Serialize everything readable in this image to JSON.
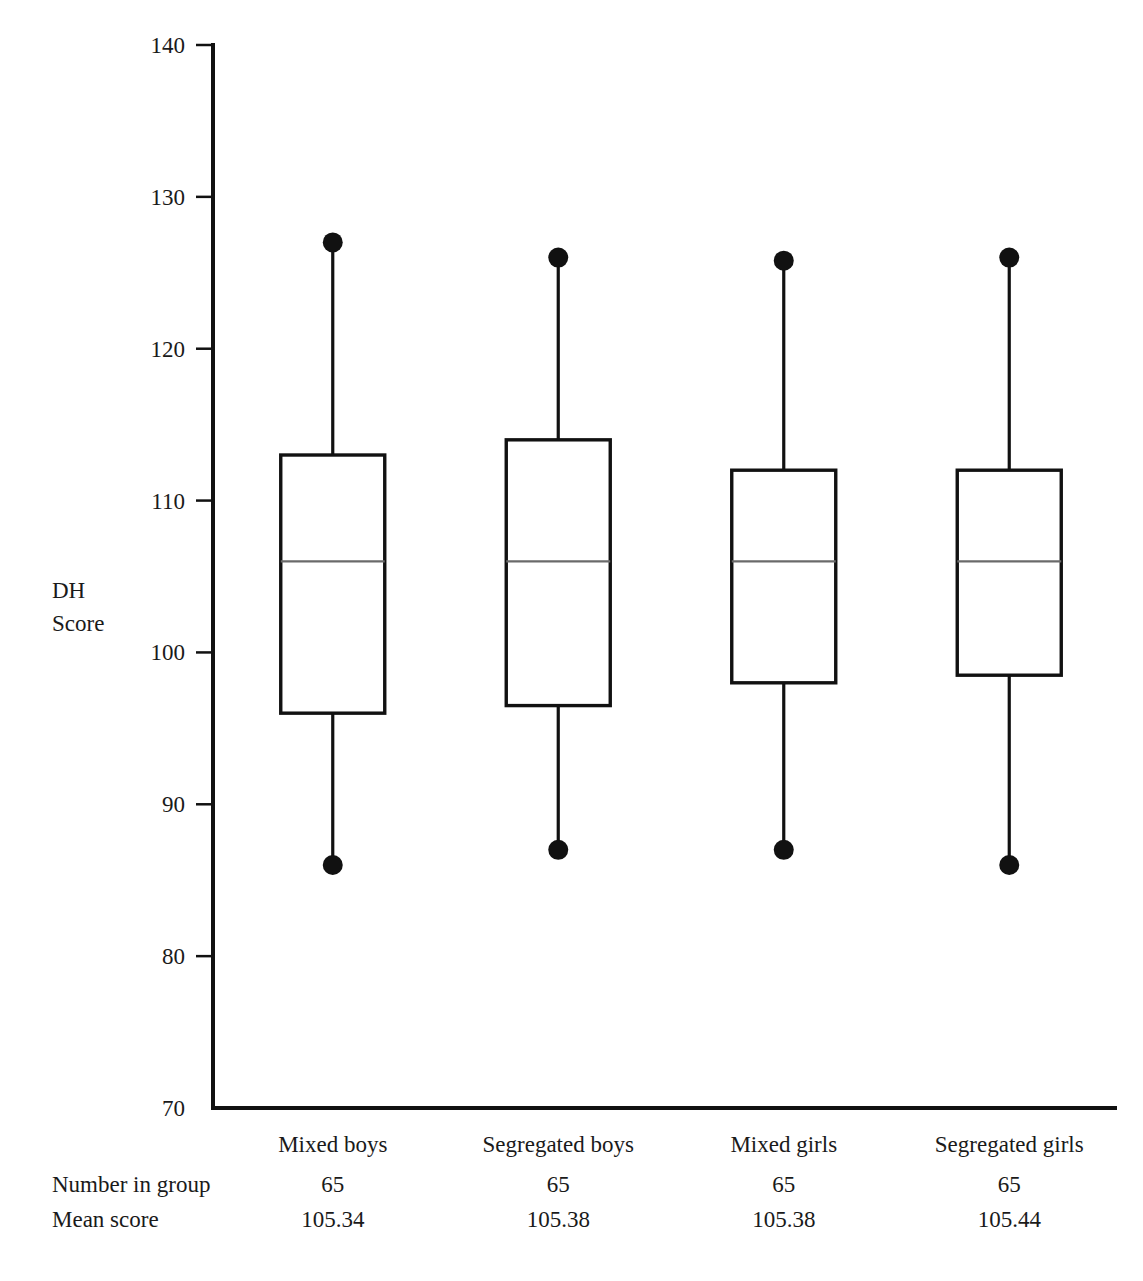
{
  "figure": {
    "top_cropped_title": "",
    "y_axis_label_line1": "DH",
    "y_axis_label_line2": "Score",
    "row_labels": {
      "number_in_group": "Number in group",
      "mean_score": "Mean score"
    }
  },
  "chart_data": {
    "type": "box",
    "title": "",
    "xlabel": "",
    "ylabel": "DH Score",
    "ylim": [
      70,
      140
    ],
    "ytick_labels": [
      "70",
      "80",
      "90",
      "100",
      "110",
      "120",
      "130",
      "140"
    ],
    "yticks": [
      70,
      80,
      90,
      100,
      110,
      120,
      130,
      140
    ],
    "grid": false,
    "legend": "none",
    "categories": [
      "Mixed boys",
      "Segregated boys",
      "Mixed girls",
      "Segregated girls"
    ],
    "boxes": [
      {
        "category": "Mixed boys",
        "min": 86,
        "q1": 96,
        "median": 106,
        "q3": 113,
        "max": 127,
        "n": "65",
        "mean": "105.34"
      },
      {
        "category": "Segregated boys",
        "min": 87,
        "q1": 96.5,
        "median": 106,
        "q3": 114,
        "max": 126,
        "n": "65",
        "mean": "105.38"
      },
      {
        "category": "Mixed girls",
        "min": 87,
        "q1": 98,
        "median": 106,
        "q3": 112,
        "max": 125.8,
        "n": "65",
        "mean": "105.38"
      },
      {
        "category": "Segregated girls",
        "min": 86,
        "q1": 98.5,
        "median": 106,
        "q3": 112,
        "max": 126,
        "n": "65",
        "mean": "105.44"
      }
    ],
    "table_rows": [
      {
        "label": "Number in group",
        "values": [
          "65",
          "65",
          "65",
          "65"
        ]
      },
      {
        "label": "Mean score",
        "values": [
          "105.34",
          "105.38",
          "105.38",
          "105.44"
        ]
      }
    ]
  }
}
